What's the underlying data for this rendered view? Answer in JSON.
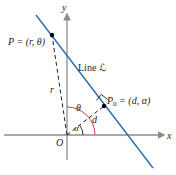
{
  "diagram": {
    "axes": {
      "x_label": "x",
      "y_label": "y",
      "origin_label": "O"
    },
    "line_label": "Line ℒ",
    "point_P": {
      "label": "P = (r, θ)"
    },
    "point_P0": {
      "label_main": "P",
      "label_sub": "0",
      "label_rest": " = (d, α)"
    },
    "segment_labels": {
      "r": "r",
      "d": "d"
    },
    "angle_labels": {
      "theta": "θ",
      "alpha": "α"
    },
    "colors": {
      "line": "#2b6cb0",
      "axes": "#8c8c8c",
      "angle_theta": "#d9373d",
      "angle_alpha": "#231f20",
      "text": "#231f20"
    }
  }
}
